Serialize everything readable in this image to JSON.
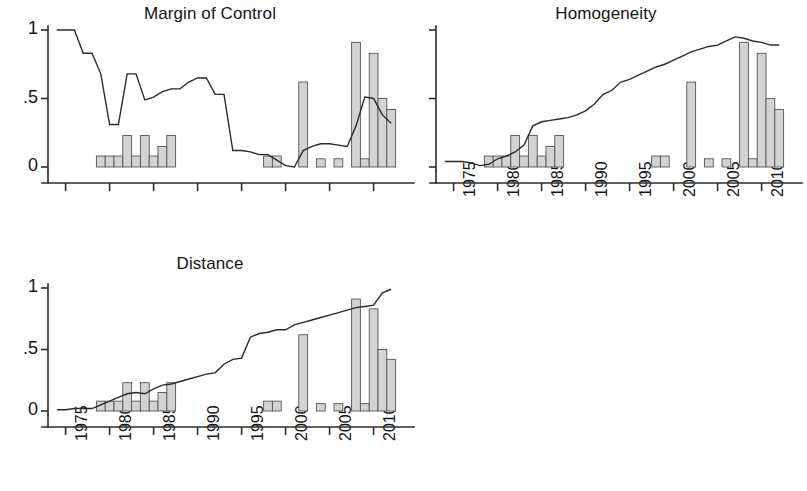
{
  "figure": {
    "width": 802,
    "height": 491,
    "background": "#ffffff",
    "line_color": "#2b2b2b",
    "bar_fill": "#d3d3d3",
    "bar_stroke": "#555555"
  },
  "panels": [
    {
      "id": "margin-of-control",
      "title": "Margin of Control",
      "show_y_labels": true,
      "show_x_labels": false
    },
    {
      "id": "homogeneity",
      "title": "Homogeneity",
      "show_y_labels": false,
      "show_x_labels": true
    },
    {
      "id": "distance",
      "title": "Distance",
      "show_y_labels": true,
      "show_x_labels": true
    }
  ],
  "axes": {
    "y_ticks": [
      0,
      0.5,
      1
    ],
    "y_tick_labels": [
      "0",
      ".5",
      "1"
    ],
    "ylim": [
      0,
      1
    ],
    "x_ticks": [
      1975,
      1980,
      1985,
      1990,
      1995,
      2000,
      2005,
      2010
    ],
    "x_tick_labels": [
      "1975",
      "1980",
      "1985",
      "1990",
      "1995",
      "2000",
      "2005",
      "2010"
    ],
    "xlim": [
      1973,
      2013
    ]
  },
  "chart_data": [
    {
      "type": "bar",
      "title": "Margin of Control",
      "xlabel": "",
      "ylabel": "",
      "ylim": [
        0,
        1
      ],
      "xlim": [
        1973,
        2013
      ],
      "grid": false,
      "legend": "none",
      "x_tick_labels": [
        "1975",
        "1980",
        "1985",
        "1990",
        "1995",
        "2000",
        "2005",
        "2010"
      ],
      "y_tick_labels": [
        "0",
        ".5",
        "1"
      ],
      "series": [
        {
          "name": "bars",
          "type": "bar",
          "x": [
            1979,
            1980,
            1981,
            1982,
            1983,
            1984,
            1985,
            1986,
            1987,
            1998,
            1999,
            2002,
            2004,
            2006,
            2008,
            2009,
            2010,
            2011,
            2012
          ],
          "values": [
            0.08,
            0.08,
            0.08,
            0.23,
            0.08,
            0.23,
            0.08,
            0.15,
            0.23,
            0.08,
            0.08,
            0.62,
            0.06,
            0.06,
            0.91,
            0.06,
            0.83,
            0.5,
            0.42
          ]
        },
        {
          "name": "line",
          "type": "line",
          "x": [
            1974,
            1975,
            1976,
            1977,
            1978,
            1979,
            1980,
            1981,
            1982,
            1983,
            1984,
            1985,
            1986,
            1987,
            1988,
            1989,
            1990,
            1991,
            1992,
            1993,
            1994,
            1995,
            1996,
            1997,
            1998,
            1999,
            2000,
            2001,
            2002,
            2003,
            2004,
            2005,
            2006,
            2007,
            2008,
            2009,
            2010,
            2011,
            2012
          ],
          "values": [
            1.0,
            1.0,
            1.0,
            0.83,
            0.83,
            0.68,
            0.31,
            0.31,
            0.68,
            0.68,
            0.49,
            0.51,
            0.55,
            0.57,
            0.57,
            0.62,
            0.65,
            0.65,
            0.53,
            0.53,
            0.12,
            0.12,
            0.11,
            0.09,
            0.09,
            0.05,
            0.01,
            0.0,
            0.12,
            0.15,
            0.17,
            0.17,
            0.16,
            0.15,
            0.3,
            0.51,
            0.5,
            0.38,
            0.32
          ]
        }
      ]
    },
    {
      "type": "bar",
      "title": "Homogeneity",
      "xlabel": "",
      "ylabel": "",
      "ylim": [
        0,
        1
      ],
      "xlim": [
        1973,
        2013
      ],
      "grid": false,
      "legend": "none",
      "x_tick_labels": [
        "1975",
        "1980",
        "1985",
        "1990",
        "1995",
        "2000",
        "2005",
        "2010"
      ],
      "y_tick_labels": [
        "0",
        ".5",
        "1"
      ],
      "series": [
        {
          "name": "bars",
          "type": "bar",
          "x": [
            1979,
            1980,
            1981,
            1982,
            1983,
            1984,
            1985,
            1986,
            1987,
            1998,
            1999,
            2002,
            2004,
            2006,
            2008,
            2009,
            2010,
            2011,
            2012
          ],
          "values": [
            0.08,
            0.08,
            0.08,
            0.23,
            0.08,
            0.23,
            0.08,
            0.15,
            0.23,
            0.08,
            0.08,
            0.62,
            0.06,
            0.06,
            0.91,
            0.06,
            0.83,
            0.5,
            0.42
          ]
        },
        {
          "name": "line",
          "type": "line",
          "x": [
            1974,
            1975,
            1976,
            1977,
            1978,
            1979,
            1980,
            1981,
            1982,
            1983,
            1984,
            1985,
            1986,
            1987,
            1988,
            1989,
            1990,
            1991,
            1992,
            1993,
            1994,
            1995,
            1996,
            1997,
            1998,
            1999,
            2000,
            2001,
            2002,
            2003,
            2004,
            2005,
            2006,
            2007,
            2008,
            2009,
            2010,
            2011,
            2012
          ],
          "values": [
            0.04,
            0.04,
            0.04,
            0.03,
            0.01,
            0.02,
            0.06,
            0.08,
            0.11,
            0.16,
            0.3,
            0.33,
            0.34,
            0.35,
            0.36,
            0.38,
            0.41,
            0.46,
            0.53,
            0.56,
            0.62,
            0.64,
            0.67,
            0.7,
            0.73,
            0.75,
            0.78,
            0.81,
            0.84,
            0.86,
            0.88,
            0.89,
            0.92,
            0.95,
            0.94,
            0.92,
            0.91,
            0.89,
            0.89
          ]
        }
      ]
    },
    {
      "type": "bar",
      "title": "Distance",
      "xlabel": "",
      "ylabel": "",
      "ylim": [
        0,
        1
      ],
      "xlim": [
        1973,
        2013
      ],
      "grid": false,
      "legend": "none",
      "x_tick_labels": [
        "1975",
        "1980",
        "1985",
        "1990",
        "1995",
        "2000",
        "2005",
        "2010"
      ],
      "y_tick_labels": [
        "0",
        ".5",
        "1"
      ],
      "series": [
        {
          "name": "bars",
          "type": "bar",
          "x": [
            1979,
            1980,
            1981,
            1982,
            1983,
            1984,
            1985,
            1986,
            1987,
            1998,
            1999,
            2002,
            2004,
            2006,
            2008,
            2009,
            2010,
            2011,
            2012
          ],
          "values": [
            0.08,
            0.08,
            0.08,
            0.23,
            0.08,
            0.23,
            0.08,
            0.15,
            0.23,
            0.08,
            0.08,
            0.62,
            0.06,
            0.06,
            0.91,
            0.06,
            0.83,
            0.5,
            0.42
          ]
        },
        {
          "name": "line",
          "type": "line",
          "x": [
            1974,
            1975,
            1976,
            1977,
            1978,
            1979,
            1980,
            1981,
            1982,
            1983,
            1984,
            1985,
            1986,
            1987,
            1988,
            1989,
            1990,
            1991,
            1992,
            1993,
            1994,
            1995,
            1996,
            1997,
            1998,
            1999,
            2000,
            2001,
            2002,
            2003,
            2004,
            2005,
            2006,
            2007,
            2008,
            2009,
            2010,
            2011,
            2012
          ],
          "values": [
            0.01,
            0.01,
            0.02,
            0.02,
            0.02,
            0.05,
            0.08,
            0.11,
            0.14,
            0.15,
            0.14,
            0.18,
            0.21,
            0.22,
            0.24,
            0.26,
            0.28,
            0.3,
            0.31,
            0.38,
            0.42,
            0.43,
            0.6,
            0.63,
            0.64,
            0.66,
            0.66,
            0.7,
            0.72,
            0.74,
            0.76,
            0.78,
            0.8,
            0.82,
            0.84,
            0.85,
            0.86,
            0.96,
            0.99
          ]
        }
      ]
    }
  ]
}
